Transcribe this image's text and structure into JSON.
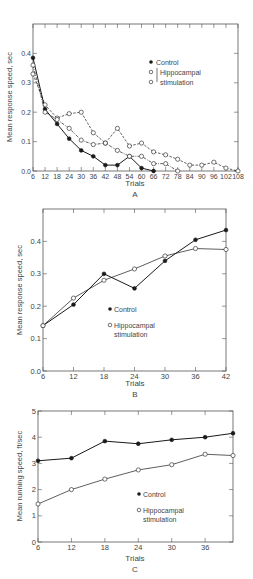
{
  "chart_data": [
    {
      "panel": "A",
      "type": "line",
      "title": "",
      "xlabel": "Trials",
      "ylabel": "Mean response speed, sec",
      "xlim": [
        6,
        108
      ],
      "ylim": [
        0.0,
        0.5
      ],
      "x_ticks": [
        6,
        12,
        18,
        24,
        30,
        36,
        42,
        48,
        54,
        60,
        66,
        72,
        78,
        84,
        90,
        96,
        102,
        108
      ],
      "y_ticks": [
        0.0,
        0.1,
        0.2,
        0.3,
        0.4
      ],
      "y_tick_labels": [
        "0.0",
        "0.1",
        "0.2",
        "0.3",
        "0.4"
      ],
      "grid": false,
      "legend": [
        "Control",
        "Hippocampal stimulation"
      ],
      "legend_position": "upper right",
      "series": [
        {
          "name": "Control",
          "marker": "filled-circle",
          "line": "solid",
          "x": [
            6,
            12,
            18,
            24,
            30,
            36,
            42,
            48,
            54,
            60,
            66
          ],
          "values": [
            0.385,
            0.21,
            0.16,
            0.11,
            0.07,
            0.05,
            0.02,
            0.02,
            0.05,
            0.01,
            0.0
          ]
        },
        {
          "name": "Hippocampal stimulation (1)",
          "marker": "open-circle",
          "line": "dashed",
          "x": [
            6,
            12,
            18,
            24,
            30,
            36,
            42,
            48,
            54,
            60,
            66,
            72,
            78,
            84,
            90,
            96,
            102,
            108
          ],
          "values": [
            0.33,
            0.225,
            0.18,
            0.195,
            0.2,
            0.13,
            0.095,
            0.145,
            0.085,
            0.095,
            0.065,
            0.055,
            0.04,
            0.02,
            0.02,
            0.03,
            0.01,
            0.0
          ]
        },
        {
          "name": "Hippocampal stimulation (2)",
          "marker": "open-circle",
          "line": "dash-dot",
          "x": [
            6,
            12,
            18,
            24,
            30,
            36,
            42,
            48,
            54,
            60,
            66,
            72,
            78
          ],
          "values": [
            0.36,
            0.2,
            0.175,
            0.145,
            0.105,
            0.09,
            0.095,
            0.07,
            0.05,
            0.05,
            0.025,
            0.025,
            0.0
          ]
        }
      ]
    },
    {
      "panel": "B",
      "type": "line",
      "title": "",
      "xlabel": "Trials",
      "ylabel": "Mean response speed, sec",
      "xlim": [
        6,
        42
      ],
      "ylim": [
        0.0,
        0.5
      ],
      "x_ticks": [
        6,
        12,
        18,
        24,
        30,
        36,
        42
      ],
      "y_ticks": [
        0.0,
        0.1,
        0.2,
        0.3,
        0.4
      ],
      "y_tick_labels": [
        "0.0",
        "0.1",
        "0.2",
        "0.3",
        "0.4"
      ],
      "grid": false,
      "legend": [
        "Control",
        "Hippocampal stimulation"
      ],
      "legend_position": "center",
      "categories": [
        6,
        12,
        18,
        24,
        30,
        36,
        42
      ],
      "series": [
        {
          "name": "Control",
          "marker": "filled-circle",
          "values": [
            0.14,
            0.205,
            0.3,
            0.255,
            0.34,
            0.405,
            0.435
          ]
        },
        {
          "name": "Hippocampal stimulation",
          "marker": "open-circle",
          "values": [
            0.14,
            0.225,
            0.28,
            0.315,
            0.355,
            0.378,
            0.375
          ]
        }
      ]
    },
    {
      "panel": "C",
      "type": "line",
      "title": "",
      "xlabel": "Trials",
      "ylabel": "Mean running speed, ft/sec",
      "xlim": [
        6,
        41
      ],
      "ylim": [
        0,
        5
      ],
      "x_ticks": [
        6,
        12,
        18,
        24,
        30,
        36
      ],
      "y_ticks": [
        0,
        1,
        2,
        3,
        4,
        5
      ],
      "y_tick_labels": [
        "0",
        "1",
        "2",
        "3",
        "4",
        "5"
      ],
      "grid": false,
      "legend": [
        "Control",
        "Hippocampal stimulation"
      ],
      "legend_position": "lower right",
      "series": [
        {
          "name": "Control",
          "marker": "filled-circle",
          "x": [
            6,
            12,
            18,
            24,
            30,
            36,
            41
          ],
          "values": [
            3.1,
            3.2,
            3.85,
            3.75,
            3.9,
            4.0,
            4.15
          ]
        },
        {
          "name": "Hippocampal stimulation",
          "marker": "open-circle",
          "x": [
            6,
            12,
            18,
            24,
            30,
            36,
            41
          ],
          "values": [
            1.45,
            2.0,
            2.4,
            2.75,
            2.95,
            3.35,
            3.3
          ]
        }
      ]
    }
  ],
  "panels": {
    "A": {
      "letter": "A",
      "xlabel": "Trials",
      "ylabel": "Mean response speed, sec",
      "legend_control": "Control",
      "legend_hippo_1": "Hippocampal",
      "legend_hippo_2": "stimulation"
    },
    "B": {
      "letter": "B",
      "xlabel": "Trials",
      "ylabel": "Mean response speed, sec",
      "legend_control": "Control",
      "legend_hippo_1": "Hippocampal",
      "legend_hippo_2": "stimulation"
    },
    "C": {
      "letter": "C",
      "xlabel": "Trials",
      "ylabel": "Mean running speed, ft/sec",
      "legend_control": "Control",
      "legend_hippo_1": "Hippocampal",
      "legend_hippo_2": "stimulation"
    }
  },
  "colors": {
    "ink": "#1a1a1a",
    "axis": "#555555",
    "text": "#444444"
  }
}
